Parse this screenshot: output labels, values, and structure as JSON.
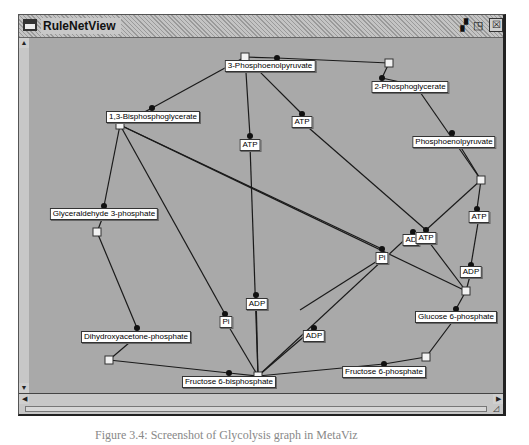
{
  "window": {
    "title": "RuleNetView",
    "buttons": {
      "minimize": "▗▘",
      "maximize": "◳",
      "close": "☒"
    }
  },
  "caption": "Figure 3.4: Screenshot of Glycolysis graph in MetaViz",
  "graph": {
    "transitions": [
      {
        "id": "t1",
        "x": 245,
        "y": 57
      },
      {
        "id": "t2",
        "x": 389,
        "y": 63
      },
      {
        "id": "t3",
        "x": 120,
        "y": 125
      },
      {
        "id": "t4",
        "x": 481,
        "y": 180
      },
      {
        "id": "t5",
        "x": 97,
        "y": 232
      },
      {
        "id": "t6",
        "x": 466,
        "y": 291
      },
      {
        "id": "t7",
        "x": 109,
        "y": 360
      },
      {
        "id": "t8",
        "x": 258,
        "y": 376
      },
      {
        "id": "t9",
        "x": 426,
        "y": 357
      }
    ],
    "places": [
      {
        "label": "3-Phosphoenolpyruvate",
        "x": 270,
        "y": 66,
        "dx": 277,
        "dy": 58
      },
      {
        "label": "2-Phosphoglycerate",
        "x": 410,
        "y": 87,
        "dx": 382,
        "dy": 78
      },
      {
        "label": "1,3-Bisphosphoglycerate",
        "x": 153,
        "y": 117,
        "dx": 152,
        "dy": 108
      },
      {
        "label": "Phosphoenolpyruvate",
        "x": 454,
        "y": 142,
        "dx": 452,
        "dy": 133
      },
      {
        "label": "ATP",
        "x": 250,
        "y": 145,
        "dx": 250,
        "dy": 136
      },
      {
        "label": "ATP",
        "x": 302,
        "y": 122,
        "dx": 302,
        "dy": 114
      },
      {
        "label": "Glyceraldehyde 3-phosphate",
        "x": 104,
        "y": 214,
        "dx": 104,
        "dy": 206
      },
      {
        "label": "ATP",
        "x": 479,
        "y": 217,
        "dx": 477,
        "dy": 209
      },
      {
        "label": "AD",
        "x": 411,
        "y": 240,
        "dx": 413,
        "dy": 232
      },
      {
        "label": "ATP",
        "x": 426,
        "y": 238,
        "dx": 426,
        "dy": 230
      },
      {
        "label": "Pi",
        "x": 382,
        "y": 258,
        "dx": 382,
        "dy": 249
      },
      {
        "label": "ADP",
        "x": 471,
        "y": 272,
        "dx": 471,
        "dy": 265
      },
      {
        "label": "ADP",
        "x": 257,
        "y": 304,
        "dx": 256,
        "dy": 295
      },
      {
        "label": "Pi",
        "x": 226,
        "y": 322,
        "dx": 225,
        "dy": 314
      },
      {
        "label": "Glucose 6-phosphate",
        "x": 456,
        "y": 317,
        "dx": 456,
        "dy": 309
      },
      {
        "label": "ADP",
        "x": 314,
        "y": 336,
        "dx": 314,
        "dy": 328
      },
      {
        "label": "Dihydroxyacetone-phosphate",
        "x": 136,
        "y": 337,
        "dx": 137,
        "dy": 328
      },
      {
        "label": "Fructose 6-phosphate",
        "x": 384,
        "y": 372,
        "dx": 384,
        "dy": 364
      },
      {
        "label": "Fructose 6-bisphosphate",
        "x": 229,
        "y": 382,
        "dx": 229,
        "dy": 373
      }
    ],
    "edges": [
      [
        245,
        57,
        277,
        58
      ],
      [
        277,
        58,
        389,
        63
      ],
      [
        389,
        63,
        382,
        78
      ],
      [
        382,
        78,
        409,
        84
      ],
      [
        420,
        92,
        481,
        180
      ],
      [
        245,
        57,
        152,
        108
      ],
      [
        152,
        108,
        120,
        125
      ],
      [
        245,
        57,
        250,
        136
      ],
      [
        250,
        145,
        258,
        376
      ],
      [
        245,
        57,
        302,
        114
      ],
      [
        302,
        122,
        426,
        230
      ],
      [
        120,
        125,
        104,
        206
      ],
      [
        104,
        214,
        97,
        232
      ],
      [
        120,
        125,
        382,
        249
      ],
      [
        120,
        125,
        466,
        291
      ],
      [
        120,
        125,
        225,
        314
      ],
      [
        226,
        322,
        258,
        376
      ],
      [
        481,
        180,
        452,
        133
      ],
      [
        481,
        180,
        477,
        209
      ],
      [
        479,
        217,
        471,
        265
      ],
      [
        471,
        272,
        466,
        291
      ],
      [
        481,
        180,
        426,
        230
      ],
      [
        426,
        238,
        466,
        291
      ],
      [
        413,
        232,
        258,
        376
      ],
      [
        466,
        291,
        456,
        309
      ],
      [
        456,
        317,
        426,
        357
      ],
      [
        426,
        357,
        384,
        364
      ],
      [
        384,
        364,
        258,
        376
      ],
      [
        97,
        232,
        137,
        328
      ],
      [
        136,
        337,
        109,
        360
      ],
      [
        109,
        360,
        229,
        373
      ],
      [
        229,
        373,
        258,
        376
      ],
      [
        314,
        328,
        258,
        376
      ],
      [
        256,
        295,
        258,
        376
      ],
      [
        382,
        258,
        300,
        310
      ]
    ]
  },
  "scrollbars": {
    "up": "▲",
    "down": "▼",
    "left": "◀",
    "right": "▶",
    "grip": "◿"
  }
}
